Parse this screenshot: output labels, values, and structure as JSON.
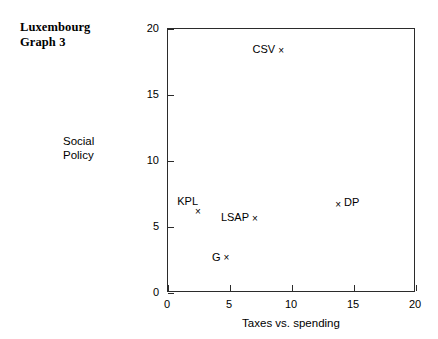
{
  "title": "Luxembourg\nGraph 3",
  "chart_data": {
    "type": "scatter",
    "title": "Luxembourg Graph 3",
    "subtitle": "",
    "xlabel": "Taxes vs. spending",
    "ylabel": "Social\nPolicy",
    "ylabel_text": "Social Policy",
    "xlim": [
      0,
      20
    ],
    "ylim": [
      0,
      20
    ],
    "xticks": [
      "0",
      "5",
      "10",
      "15",
      "20"
    ],
    "yticks": [
      "0",
      "5",
      "10",
      "15",
      "20"
    ],
    "xtick_values": [
      0,
      5,
      10,
      15,
      20
    ],
    "ytick_values": [
      0,
      5,
      10,
      15,
      20
    ],
    "grid": false,
    "legend": "none",
    "marker": "x",
    "marker_color": "#000000",
    "points": [
      {
        "label": "CSV",
        "x": 9.2,
        "y": 18.3,
        "label_position": "left"
      },
      {
        "label": "DP",
        "x": 13.8,
        "y": 6.6,
        "label_position": "right"
      },
      {
        "label": "KPL",
        "x": 2.5,
        "y": 6.1,
        "label_position": "upleft"
      },
      {
        "label": "LSAP",
        "x": 7.1,
        "y": 5.6,
        "label_position": "left"
      },
      {
        "label": "G",
        "x": 4.8,
        "y": 2.6,
        "label_position": "left"
      }
    ]
  }
}
